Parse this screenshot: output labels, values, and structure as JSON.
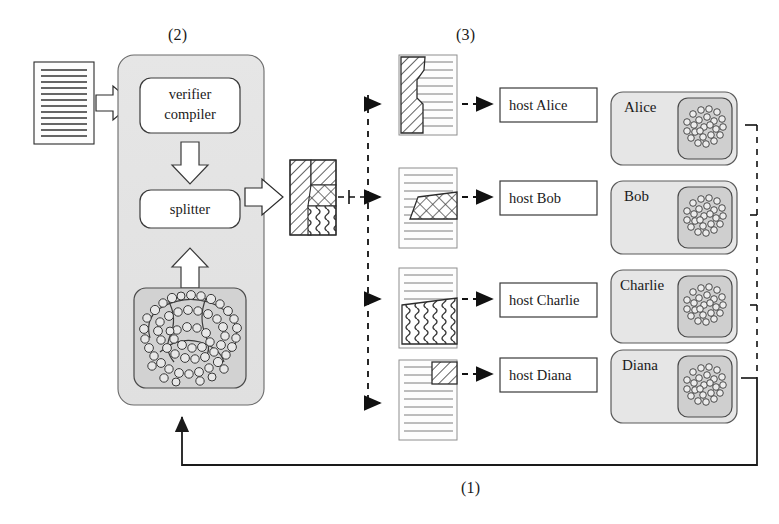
{
  "figure": {
    "background_color": "#ffffff",
    "line_color": "#1a1a1a",
    "panel_fill": "#e3e3e3",
    "inner_fill": "#d0d0d0",
    "paper_fill": "#fdfdfd",
    "step_labels": [
      {
        "text": "(2)",
        "x": 177,
        "y": 36
      },
      {
        "text": "(3)",
        "x": 465,
        "y": 36
      },
      {
        "text": "(1)",
        "x": 470,
        "y": 489
      }
    ]
  },
  "input_document": {
    "name": "source-program-document",
    "line_count": 13
  },
  "compiler_panel": {
    "name": "verifier-compiler-panel",
    "blocks": [
      {
        "id": "verifier-compiler",
        "line1": "verifier",
        "line2": "compiler"
      },
      {
        "id": "splitter",
        "line1": "splitter",
        "line2": ""
      }
    ],
    "molecule_box": {
      "id": "protein-structure",
      "label": ""
    }
  },
  "split_output": {
    "name": "combined-share-block",
    "regions": [
      {
        "id": "region-diagonal-left",
        "pattern": "diagonal-hatch"
      },
      {
        "id": "region-diagonal-topright",
        "pattern": "diagonal-hatch"
      },
      {
        "id": "region-crosshatch",
        "pattern": "crosshatch"
      },
      {
        "id": "region-wavy",
        "pattern": "wavy"
      }
    ]
  },
  "shares": [
    {
      "id": "share-alice",
      "owner": "Alice",
      "pattern": "diagonal-hatch",
      "region": "left-column"
    },
    {
      "id": "share-bob",
      "owner": "Bob",
      "pattern": "crosshatch",
      "region": "middle-band"
    },
    {
      "id": "share-charlie",
      "owner": "Charlie",
      "pattern": "wavy",
      "region": "bottom-block"
    },
    {
      "id": "share-diana",
      "owner": "Diana",
      "pattern": "diagonal-hatch",
      "region": "top-right-square"
    }
  ],
  "hosts": [
    {
      "id": "host-alice",
      "label": "host Alice"
    },
    {
      "id": "host-bob",
      "label": "host Bob"
    },
    {
      "id": "host-charlie",
      "label": "host Charlie"
    },
    {
      "id": "host-diana",
      "label": "host Diana"
    }
  ],
  "participants": [
    {
      "id": "participant-alice",
      "label": "Alice"
    },
    {
      "id": "participant-bob",
      "label": "Bob"
    },
    {
      "id": "participant-charlie",
      "label": "Charlie"
    },
    {
      "id": "participant-diana",
      "label": "Diana"
    }
  ],
  "connectors": {
    "input_arrow": "block-arrow-right",
    "compiler_to_splitter": "block-arrow-down",
    "molecule_to_splitter": "block-arrow-up",
    "splitter_to_block": "block-arrow-right",
    "distribution_bus": "dashed-vertical",
    "share_to_host": "dashed-arrow-right",
    "collection_bus": "dashed-vertical-right",
    "feedback_path": "solid-return-line"
  }
}
